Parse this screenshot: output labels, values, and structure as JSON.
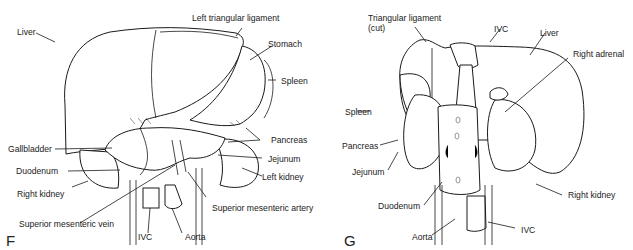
{
  "figures": [
    {
      "panel_letter": "F",
      "labels": {
        "liver": "Liver",
        "left_triangular_ligament": "Left triangular ligament",
        "stomach": "Stomach",
        "spleen": "Spleen",
        "pancreas": "Pancreas",
        "gallbladder": "Gallbladder",
        "jejunum": "Jejunum",
        "duodenum": "Duodenum",
        "left_kidney": "Left kidney",
        "right_kidney": "Right kidney",
        "superior_mesenteric_artery": "Superior mesenteric artery",
        "superior_mesenteric_vein": "Superior mesenteric vein",
        "ivc": "IVC",
        "aorta": "Aorta"
      }
    },
    {
      "panel_letter": "G",
      "labels": {
        "triangular_ligament": "Triangular ligament",
        "triangular_ligament_note": "(cut)",
        "ivc_top": "IVC",
        "liver": "Liver",
        "right_adrenal": "Right adrenal",
        "spleen": "Spleen",
        "pancreas": "Pancreas",
        "jejunum": "Jejunum",
        "duodenum": "Duodenum",
        "right_kidney": "Right kidney",
        "aorta": "Aorta",
        "ivc_bottom": "IVC"
      }
    }
  ]
}
